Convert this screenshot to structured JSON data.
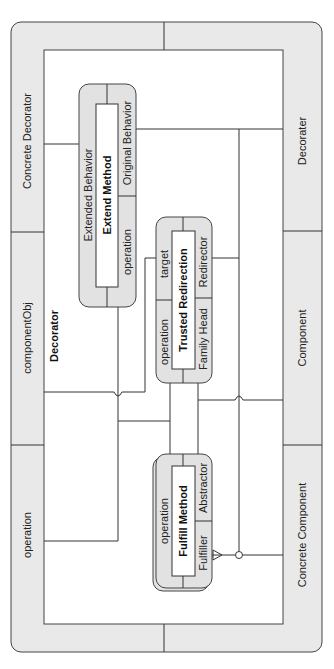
{
  "diagram": {
    "title": "Decorator",
    "lanes": {
      "left": [
        "Concrete Decorator",
        "componentObj",
        "operation"
      ],
      "right": [
        "Decorater",
        "Component",
        "Concrete Component"
      ]
    },
    "nodes": [
      {
        "id": "extend",
        "name": "Extend Method",
        "ports": {
          "top_left": "Extended Behavior",
          "top_right": "Original Behavior",
          "bottom_right": "operation"
        }
      },
      {
        "id": "trusted",
        "name": "Trusted Redirection",
        "ports": {
          "left_top": "target",
          "left_bottom": "operation",
          "right_top": "Redirector",
          "right_bottom": "Family Head"
        }
      },
      {
        "id": "fulfill",
        "name": "Fulfill Method",
        "ports": {
          "left": "operation",
          "right_top": "Abstractor",
          "right_bottom": "Fulfiller"
        }
      }
    ],
    "colors": {
      "lane_fill": "#e9e9e9",
      "node_fill": "#e2e2e2",
      "line": "#333333"
    }
  }
}
